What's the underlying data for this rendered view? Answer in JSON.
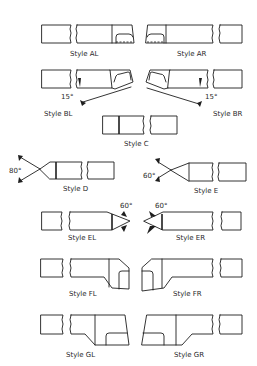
{
  "figure": {
    "styles": [
      {
        "id": "AL",
        "label": "Style AL"
      },
      {
        "id": "AR",
        "label": "Style AR"
      },
      {
        "id": "BL",
        "label": "Style BL",
        "angle": "15°"
      },
      {
        "id": "BR",
        "label": "Style BR",
        "angle": "15°"
      },
      {
        "id": "C",
        "label": "Style C"
      },
      {
        "id": "D",
        "label": "Style D",
        "angle": "80°"
      },
      {
        "id": "E",
        "label": "Style E",
        "angle": "60°"
      },
      {
        "id": "EL",
        "label": "Style EL",
        "angle": "60°"
      },
      {
        "id": "ER",
        "label": "Style ER",
        "angle": "60°"
      },
      {
        "id": "FL",
        "label": "Style FL"
      },
      {
        "id": "FR",
        "label": "Style FR"
      },
      {
        "id": "GL",
        "label": "Style GL"
      },
      {
        "id": "GR",
        "label": "Style GR"
      }
    ]
  },
  "colors": {
    "line": "#1e1e1e",
    "text": "#2a2a2a",
    "background": "#ffffff"
  }
}
